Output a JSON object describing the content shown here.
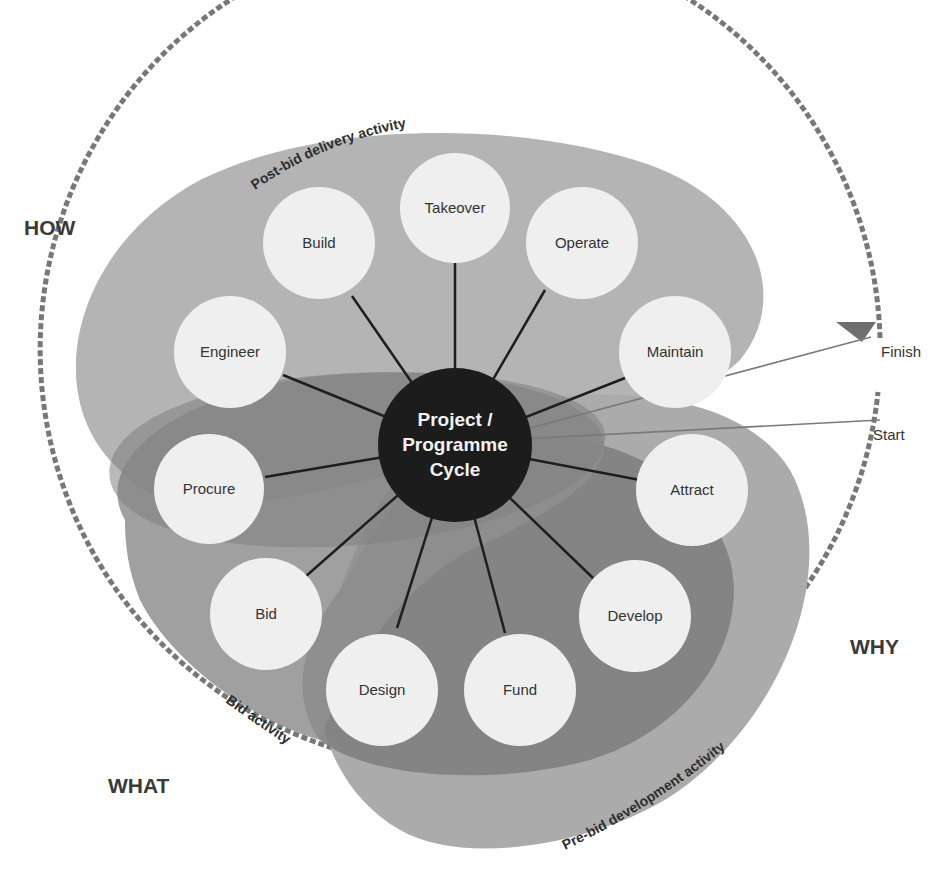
{
  "diagram": {
    "hub": {
      "line1": "Project /",
      "line2": "Programme",
      "line3": "Cycle"
    },
    "stages": [
      {
        "id": "takeover",
        "label": "Takeover"
      },
      {
        "id": "operate",
        "label": "Operate"
      },
      {
        "id": "maintain",
        "label": "Maintain"
      },
      {
        "id": "attract",
        "label": "Attract"
      },
      {
        "id": "develop",
        "label": "Develop"
      },
      {
        "id": "fund",
        "label": "Fund"
      },
      {
        "id": "design",
        "label": "Design"
      },
      {
        "id": "bid",
        "label": "Bid"
      },
      {
        "id": "procure",
        "label": "Procure"
      },
      {
        "id": "engineer",
        "label": "Engineer"
      },
      {
        "id": "build",
        "label": "Build"
      }
    ],
    "activity_zones": {
      "post_bid": "Post-bid delivery activity",
      "bid": "Bid activity",
      "pre_bid": "Pre-bid development activity"
    },
    "quadrants": {
      "how": "HOW",
      "why": "WHY",
      "what": "WHAT"
    },
    "markers": {
      "start": "Start",
      "finish": "Finish"
    },
    "colors": {
      "background": "#ffffff",
      "hub": "#1c1c1c",
      "node_fill": "#efefef",
      "post_bid_zone": "#b4b4b4",
      "bid_zone": "#8f8f8f",
      "pre_bid_zone": "#a9a9a9",
      "pre_bid_inner": "#7e7e7e",
      "dashed_ring": "#777777",
      "spoke": "#1e1e1e"
    }
  }
}
